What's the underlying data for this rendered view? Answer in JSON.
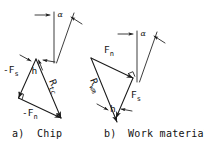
{
  "figure": {
    "ink_color": "#1a1a1a",
    "background_color": "#ffffff",
    "width": 204,
    "height": 147
  },
  "panels": [
    {
      "id": "a",
      "caption_index": "a)",
      "caption_label": "Chip",
      "angle_symbol": "α",
      "angle_name": "alpha",
      "interior_angle_label": "h",
      "vectors": [
        {
          "name": "minus-F-s",
          "base": "-F",
          "sub": "s",
          "text": "-Fₛ"
        },
        {
          "name": "R-tc",
          "base": "R",
          "sub": "tc",
          "text": "Rₜ₋"
        },
        {
          "name": "minus-F-n",
          "base": "-F",
          "sub": "n",
          "text": "-Fₙ"
        }
      ]
    },
    {
      "id": "b",
      "caption_index": "b)",
      "caption_label": "Work material",
      "angle_symbol": "α",
      "angle_name": "alpha",
      "interior_angle_label": "h",
      "vectors": [
        {
          "name": "F-n",
          "base": "F",
          "sub": "n",
          "text": "Fₙ"
        },
        {
          "name": "R-wm",
          "base": "R",
          "sub": "wm",
          "text": "Rᵥₘ"
        },
        {
          "name": "F-s",
          "base": "F",
          "sub": "s",
          "text": "Fₛ"
        }
      ]
    }
  ],
  "labels": {
    "panel_a": {
      "alpha": "α",
      "h": "h",
      "fs_base": "-F",
      "fs_sub": "s",
      "rtc_base": "R",
      "rtc_sub": "tc",
      "fn_base": "-F",
      "fn_sub": "n",
      "caption_index": "a)",
      "caption_label": "Chip"
    },
    "panel_b": {
      "alpha": "α",
      "h": "h",
      "fn_base": "F",
      "fn_sub": "n",
      "rwm_base": "R",
      "rwm_sub": "wm",
      "fs_base": "F",
      "fs_sub": "s",
      "caption_index": "b)",
      "caption_label": "Work material"
    }
  }
}
